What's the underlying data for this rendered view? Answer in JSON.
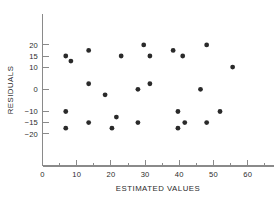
{
  "chart_data": {
    "type": "scatter",
    "title": "",
    "xlabel": "ESTIMATED VALUES",
    "ylabel": "RESIDUALS",
    "xlim": [
      0,
      68
    ],
    "ylim": [
      -23,
      23
    ],
    "grid": false,
    "legend": null,
    "xticks": [
      0,
      10,
      20,
      30,
      40,
      50,
      60
    ],
    "xtick_labels": [
      "0",
      "10",
      "20",
      "30",
      "40",
      "50",
      "60"
    ],
    "xminor_ticks": [
      5,
      15,
      25,
      35,
      45,
      55,
      65
    ],
    "yticks": [
      20,
      15,
      10,
      0,
      -10,
      -15,
      -20
    ],
    "ytick_labels": [
      "20",
      "15",
      "10",
      "0",
      "-10",
      "-15",
      "-20"
    ],
    "marker": "filled-circle",
    "marker_color": "#2a2a2a",
    "marker_size": 2.4,
    "points": [
      {
        "x": 6.8,
        "y": 15.0
      },
      {
        "x": 6.8,
        "y": -10.0
      },
      {
        "x": 6.8,
        "y": -17.5
      },
      {
        "x": 8.3,
        "y": 12.7
      },
      {
        "x": 13.5,
        "y": 17.5
      },
      {
        "x": 13.5,
        "y": 2.5
      },
      {
        "x": 13.5,
        "y": -15.0
      },
      {
        "x": 18.3,
        "y": -2.5
      },
      {
        "x": 20.3,
        "y": -17.5
      },
      {
        "x": 21.6,
        "y": -12.5
      },
      {
        "x": 23.0,
        "y": 15.0
      },
      {
        "x": 27.9,
        "y": -15.0
      },
      {
        "x": 29.6,
        "y": 20.0
      },
      {
        "x": 31.4,
        "y": 15.0
      },
      {
        "x": 31.4,
        "y": 2.5
      },
      {
        "x": 27.9,
        "y": 0.0
      },
      {
        "x": 38.2,
        "y": 17.5
      },
      {
        "x": 39.6,
        "y": -10.0
      },
      {
        "x": 39.6,
        "y": -17.5
      },
      {
        "x": 41.0,
        "y": 15.0
      },
      {
        "x": 41.6,
        "y": -15.0
      },
      {
        "x": 46.2,
        "y": 0.0
      },
      {
        "x": 48.0,
        "y": 20.0
      },
      {
        "x": 48.0,
        "y": -15.0
      },
      {
        "x": 51.9,
        "y": -10.0
      },
      {
        "x": 55.6,
        "y": 10.0
      }
    ]
  },
  "axis": {
    "x_title": "ESTIMATED VALUES",
    "y_title": "RESIDUALS"
  }
}
